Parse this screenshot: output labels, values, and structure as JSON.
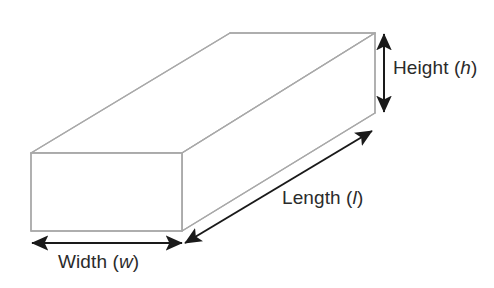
{
  "figure": {
    "kind": "rectangular-prism-dimension-diagram",
    "background_color": "#ffffff",
    "solid": {
      "name": "cuboid",
      "edge_color": "#a9a9a9",
      "face_color": "#ffffff",
      "edge_width": 1.4
    },
    "annotation_color": "#1a1a1a",
    "text_color": "#2b2b2b"
  },
  "labels": {
    "height": {
      "text": "Height",
      "open_paren": "(",
      "symbol": "h",
      "close_paren": ")"
    },
    "length": {
      "text": "Length",
      "open_paren": "(",
      "symbol": "l",
      "close_paren": ")"
    },
    "width": {
      "text": "Width",
      "open_paren": "(",
      "symbol": "w",
      "close_paren": ")"
    }
  },
  "dimension_arrows": [
    {
      "name": "height-arrow",
      "orientation": "vertical",
      "x1": 384,
      "y1": 34,
      "x2": 384,
      "y2": 112,
      "double_headed": true
    },
    {
      "name": "length-arrow",
      "orientation": "diagonal",
      "x1": 185,
      "y1": 243,
      "x2": 372,
      "y2": 131,
      "double_headed": true
    },
    {
      "name": "width-arrow",
      "orientation": "horizontal",
      "x1": 32,
      "y1": 243,
      "x2": 182,
      "y2": 243,
      "double_headed": true
    }
  ]
}
